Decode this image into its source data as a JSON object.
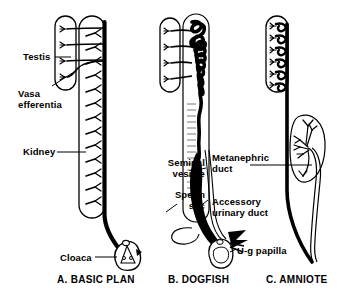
{
  "figure": {
    "background_color": "#ffffff",
    "ink_color": "#000000",
    "style": "black-and-white line drawing"
  },
  "labels": {
    "testis": "Testis",
    "vasa_efferentia": "Vasa\nefferentia",
    "kidney": "Kidney",
    "cloaca": "Cloaca",
    "seminal_vesicle": "Seminal\nvesicle",
    "sperm_sac": "Sperm\nsac",
    "metanephric_duct": "Metanephric\nduct",
    "accessory_urinary_duct": "Accessory\nurinary duct",
    "ug_papilla": "U-g papilla"
  },
  "panels": [
    {
      "id": "a",
      "caption": "A. BASIC PLAN",
      "parts": [
        "testis",
        "vasa efferentia",
        "kidney",
        "archinephric duct",
        "cloaca"
      ]
    },
    {
      "id": "b",
      "caption": "B. DOGFISH",
      "parts": [
        "testis",
        "vasa efferentia",
        "coiled epididymis",
        "seminal vesicle",
        "sperm sac",
        "accessory urinary duct",
        "urogenital papilla"
      ]
    },
    {
      "id": "c",
      "caption": "C. AMNIOTE",
      "parts": [
        "testis",
        "epididymis",
        "ductus deferens",
        "metanephros",
        "metanephric duct"
      ]
    }
  ]
}
